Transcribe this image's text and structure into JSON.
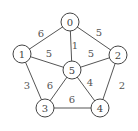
{
  "graph": {
    "type": "undirected-weighted-graph",
    "nodes": [
      {
        "id": "0",
        "label": "0",
        "x": 70,
        "y": 22
      },
      {
        "id": "1",
        "label": "1",
        "x": 22,
        "y": 54
      },
      {
        "id": "2",
        "label": "2",
        "x": 118,
        "y": 55
      },
      {
        "id": "3",
        "label": "3",
        "x": 45,
        "y": 108
      },
      {
        "id": "4",
        "label": "4",
        "x": 100,
        "y": 108
      },
      {
        "id": "5",
        "label": "5",
        "x": 72,
        "y": 70
      }
    ],
    "edges": [
      {
        "from": "0",
        "to": "1",
        "weight": "6",
        "lx": 41,
        "ly": 33
      },
      {
        "from": "0",
        "to": "2",
        "weight": "5",
        "lx": 99,
        "ly": 32
      },
      {
        "from": "0",
        "to": "5",
        "weight": "1",
        "lx": 75,
        "ly": 45
      },
      {
        "from": "1",
        "to": "5",
        "weight": "5",
        "lx": 49,
        "ly": 53
      },
      {
        "from": "2",
        "to": "5",
        "weight": "5",
        "lx": 91,
        "ly": 53
      },
      {
        "from": "1",
        "to": "3",
        "weight": "3",
        "lx": 27,
        "ly": 85
      },
      {
        "from": "3",
        "to": "5",
        "weight": "6",
        "lx": 50,
        "ly": 85
      },
      {
        "from": "4",
        "to": "5",
        "weight": "4",
        "lx": 90,
        "ly": 82
      },
      {
        "from": "2",
        "to": "4",
        "weight": "2",
        "lx": 122,
        "ly": 85
      },
      {
        "from": "3",
        "to": "4",
        "weight": "6",
        "lx": 72,
        "ly": 99
      }
    ],
    "node_radius": 9
  }
}
